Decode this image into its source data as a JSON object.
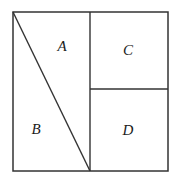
{
  "figure": {
    "background_color": "#ffffff",
    "line_color": "#333333",
    "label_color": "#1b1b1b",
    "outer_square": {
      "name": "outer-square",
      "x": 13,
      "y": 12,
      "width": 155,
      "height": 159
    },
    "dividers": [
      {
        "name": "vertical-divider",
        "orientation": "vertical",
        "x1": 90,
        "y1": 12,
        "x2": 90,
        "y2": 171
      },
      {
        "name": "horizontal-divider",
        "orientation": "horizontal",
        "x1": 90,
        "y1": 89,
        "x2": 168,
        "y2": 89
      },
      {
        "name": "diagonal-divider",
        "orientation": "diagonal",
        "x1": 13,
        "y1": 12,
        "x2": 90,
        "y2": 171
      }
    ],
    "regions": [
      {
        "id": "A",
        "label": "A",
        "label_x": 62,
        "label_y": 48,
        "description": "upper-left triangle right of diagonal"
      },
      {
        "id": "B",
        "label": "B",
        "label_x": 36,
        "label_y": 131,
        "description": "lower-left triangle left of diagonal"
      },
      {
        "id": "C",
        "label": "C",
        "label_x": 128,
        "label_y": 52,
        "description": "upper-right rectangle"
      },
      {
        "id": "D",
        "label": "D",
        "label_x": 128,
        "label_y": 132,
        "description": "lower-right rectangle"
      }
    ]
  }
}
